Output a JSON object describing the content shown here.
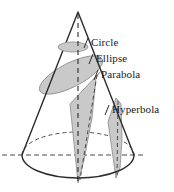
{
  "figure": {
    "width": 174,
    "height": 192,
    "background_color": "#ffffff",
    "stroke_color": "#2b2b2b",
    "shade_color": "#c9c9c9",
    "shade_stroke_color": "#8a8a8a",
    "dash_color": "#4d4d4d"
  },
  "labels": {
    "circle": "Circle",
    "ellipse": "Ellipse",
    "parabola": "Parabola",
    "hyperbola": "Hyperbola"
  },
  "geometry": {
    "apex": {
      "x": 78,
      "y": 12
    },
    "base_center": {
      "x": 78,
      "y": 155
    },
    "base_rx": 56,
    "base_ry": 23,
    "axis_label": "vertical axis",
    "horizontal_line_from_x": 2,
    "horizontal_line_to_x": 146,
    "horizontal_line_y": 155
  },
  "sections": [
    {
      "name": "circle",
      "kind": "horizontal cross-section",
      "shape": "ellipse"
    },
    {
      "name": "ellipse",
      "kind": "oblique cross-section",
      "shape": "ellipse"
    },
    {
      "name": "parabola",
      "kind": "slant-parallel section",
      "shape": "wedge"
    },
    {
      "name": "hyperbola",
      "kind": "vertical section",
      "shape": "wedge"
    }
  ]
}
